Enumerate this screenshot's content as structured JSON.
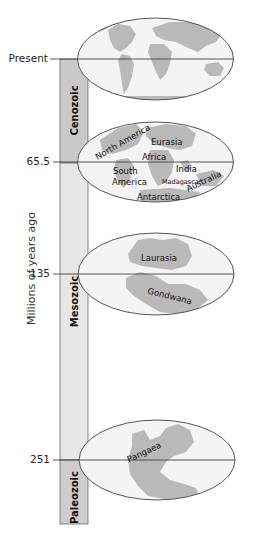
{
  "axis": {
    "label": "Millions of years ago",
    "ticks": [
      {
        "label": "Present",
        "value": 0
      },
      {
        "label": "65.5",
        "value": 65.5
      },
      {
        "label": "135",
        "value": 135
      },
      {
        "label": "251",
        "value": 251
      }
    ]
  },
  "eras": [
    {
      "name": "Cenozoic",
      "from": "Present",
      "to": "65.5",
      "color": "#c9c9c9"
    },
    {
      "name": "Mesozoic",
      "from": "65.5",
      "to": "251",
      "color": "#e6e6e6"
    },
    {
      "name": "Paleozoic",
      "from": "251",
      "to": "",
      "color": "#cdcdcd"
    }
  ],
  "maps": [
    {
      "time": "Present",
      "labels": []
    },
    {
      "time": "65.5",
      "labels": [
        "North America",
        "Eurasia",
        "Africa",
        "South America",
        "India",
        "Madagascar",
        "Australia",
        "Antarctica"
      ]
    },
    {
      "time": "135",
      "labels": [
        "Laurasia",
        "Gondwana"
      ]
    },
    {
      "time": "251",
      "labels": [
        "Pangaea"
      ]
    }
  ],
  "labels": {
    "present": "Present",
    "t65": "65.5",
    "t135": "135",
    "t251": "251",
    "axis": "Millions of years ago",
    "cenozoic": "Cenozoic",
    "mesozoic": "Mesozoic",
    "paleozoic": "Paleozoic",
    "north_america": "North America",
    "eurasia": "Eurasia",
    "africa": "Africa",
    "south": "South",
    "america": "America",
    "india": "India",
    "madagascar": "Madagascar",
    "australia": "Australia",
    "antarctica": "Antarctica",
    "laurasia": "Laurasia",
    "gondwana": "Gondwana",
    "pangaea": "Pangaea"
  },
  "colors": {
    "ellipse_fill": "#f4f4f4",
    "land": "#b9b9b9",
    "land_dark": "#a6a6a6",
    "stroke": "#555555"
  }
}
